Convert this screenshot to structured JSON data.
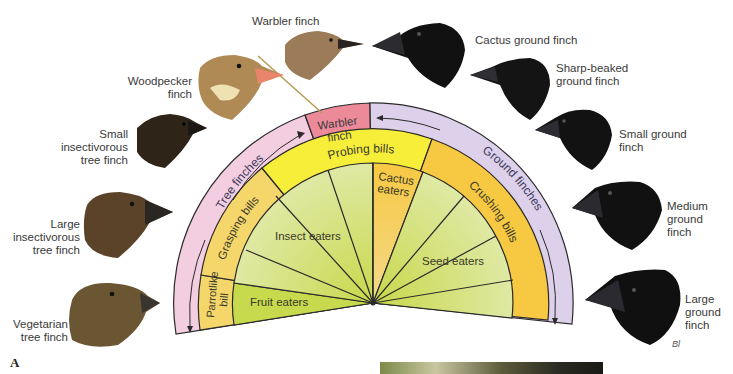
{
  "figure": {
    "panel_label": "A",
    "colors": {
      "tree_band": "#f3cde0",
      "ground_band": "#ddd0ea",
      "warbler_band": "#ec8a9a",
      "probing_band": "#f7ee3a",
      "grasping_band": "#f5d66a",
      "parrot_band": "#f5d66a",
      "crushing_band": "#f7c842",
      "cactus_wedge": "#f6c949",
      "green_wedge": "#d5e38a",
      "fruit_wedge": "#c7d94c",
      "outline": "#2a2a2a"
    }
  },
  "outer_ring": {
    "tree_finches": "Tree finches",
    "warbler": [
      "Warbler",
      "finch"
    ],
    "ground_finches": "Ground finches"
  },
  "middle_ring": {
    "parrotlike": [
      "Parrotlike",
      "bill"
    ],
    "grasping": "Grasping bills",
    "probing": "Probing bills",
    "crushing": "Crushing bills"
  },
  "inner_wedges": {
    "fruit": "Fruit eaters",
    "insect": "Insect eaters",
    "cactus": [
      "Cactus",
      "eaters"
    ],
    "seed": "Seed eaters"
  },
  "finches": [
    {
      "id": "vegetarian",
      "label": [
        "Vegetarian",
        "tree finch"
      ],
      "color": "#6b5634"
    },
    {
      "id": "large-insectivorous",
      "label": [
        "Large",
        "insectivorous",
        "tree finch"
      ],
      "color": "#5b4329"
    },
    {
      "id": "small-insectivorous",
      "label": [
        "Small",
        "insectivorous",
        "tree finch"
      ],
      "color": "#2e2418"
    },
    {
      "id": "woodpecker",
      "label": [
        "Woodpecker",
        "finch"
      ],
      "color": "#b08a55"
    },
    {
      "id": "warbler",
      "label": [
        "Warbler finch"
      ],
      "color": "#9c7b58"
    },
    {
      "id": "cactus-ground",
      "label": [
        "Cactus ground finch"
      ],
      "color": "#111111"
    },
    {
      "id": "sharp-beaked-ground",
      "label": [
        "Sharp-beaked",
        "ground finch"
      ],
      "color": "#141414"
    },
    {
      "id": "small-ground",
      "label": [
        "Small ground",
        "finch"
      ],
      "color": "#121212"
    },
    {
      "id": "medium-ground",
      "label": [
        "Medium",
        "ground",
        "finch"
      ],
      "color": "#111111"
    },
    {
      "id": "large-ground",
      "label": [
        "Large",
        "ground",
        "finch"
      ],
      "color": "#101010"
    }
  ]
}
